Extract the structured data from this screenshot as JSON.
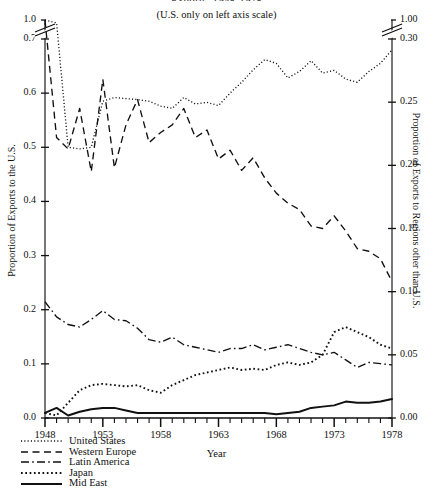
{
  "title": "Exports, 1948-1978",
  "subtitle": "(U.S. only on left axis scale)",
  "axis": {
    "left_label": "Proportion of Exports to the U.S.",
    "right_label": "Proportion of Exports to Regions other than U.S.",
    "x_label": "Year",
    "left_ticks": [
      "0.0",
      "0.1",
      "0.2",
      "0.3",
      "0.4",
      "0.5",
      "0.6",
      "0.7",
      "1.0"
    ],
    "right_ticks": [
      "0.00",
      "0.05",
      "0.10",
      "0.15",
      "0.20",
      "0.25",
      "0.30",
      "1.00"
    ],
    "x_ticks": [
      "1948",
      "1953",
      "1958",
      "1963",
      "1968",
      "1973",
      "1978"
    ]
  },
  "legend": [
    {
      "label": "United States",
      "style": "fine-dotted"
    },
    {
      "label": "Western Europe",
      "style": "dashed"
    },
    {
      "label": "Latin America",
      "style": "dash-dot"
    },
    {
      "label": "Japan",
      "style": "dotted"
    },
    {
      "label": "Mid East",
      "style": "solid"
    }
  ],
  "chart_data": {
    "type": "line",
    "title": "Exports, 1948-1978",
    "subtitle": "(U.S. only on left axis scale)",
    "xlabel": "Year",
    "ylabel": "Proportion of Exports to the U.S.",
    "ylabel_right": "Proportion of Exports to Regions other than U.S.",
    "xlim": [
      1948,
      1978
    ],
    "ylim_left": [
      0.0,
      0.7
    ],
    "ylim_right": [
      0.0,
      0.3
    ],
    "left_axis_break": {
      "below": 0.7,
      "above": 1.0
    },
    "right_axis_break": {
      "below": 0.3,
      "above": 1.0
    },
    "grid": false,
    "legend_position": "below-left",
    "x": [
      1948,
      1949,
      1950,
      1951,
      1952,
      1953,
      1954,
      1955,
      1956,
      1957,
      1958,
      1959,
      1960,
      1961,
      1962,
      1963,
      1964,
      1965,
      1966,
      1967,
      1968,
      1969,
      1970,
      1971,
      1972,
      1973,
      1974,
      1975,
      1976,
      1977,
      1978
    ],
    "series": [
      {
        "name": "United States",
        "axis": "left",
        "style": "fine-dotted",
        "values": [
          0.735,
          0.73,
          0.5,
          0.497,
          0.5,
          0.585,
          0.592,
          0.59,
          0.588,
          0.585,
          0.576,
          0.572,
          0.592,
          0.58,
          0.583,
          0.577,
          0.6,
          0.62,
          0.643,
          0.662,
          0.655,
          0.628,
          0.64,
          0.66,
          0.637,
          0.642,
          0.626,
          0.62,
          0.64,
          0.655,
          0.68
        ]
      },
      {
        "name": "Western Europe",
        "axis": "right",
        "style": "dashed",
        "values": [
          0.315,
          0.222,
          0.213,
          0.245,
          0.195,
          0.268,
          0.198,
          0.232,
          0.252,
          0.218,
          0.226,
          0.232,
          0.245,
          0.222,
          0.228,
          0.205,
          0.212,
          0.196,
          0.206,
          0.19,
          0.178,
          0.17,
          0.165,
          0.152,
          0.15,
          0.16,
          0.148,
          0.134,
          0.132,
          0.126,
          0.108
        ]
      },
      {
        "name": "Latin America",
        "axis": "right",
        "style": "dash-dot",
        "values": [
          0.092,
          0.08,
          0.074,
          0.072,
          0.078,
          0.085,
          0.078,
          0.077,
          0.071,
          0.062,
          0.06,
          0.064,
          0.058,
          0.056,
          0.054,
          0.052,
          0.055,
          0.055,
          0.058,
          0.054,
          0.056,
          0.058,
          0.055,
          0.052,
          0.05,
          0.052,
          0.046,
          0.04,
          0.044,
          0.043,
          0.042
        ]
      },
      {
        "name": "Japan",
        "axis": "right",
        "style": "dotted",
        "values": [
          0.004,
          0.002,
          0.012,
          0.022,
          0.026,
          0.027,
          0.026,
          0.025,
          0.026,
          0.022,
          0.02,
          0.026,
          0.03,
          0.034,
          0.036,
          0.038,
          0.04,
          0.038,
          0.039,
          0.038,
          0.042,
          0.044,
          0.042,
          0.044,
          0.05,
          0.068,
          0.072,
          0.068,
          0.064,
          0.058,
          0.055
        ]
      },
      {
        "name": "Mid East",
        "axis": "right",
        "style": "solid",
        "values": [
          0.004,
          0.008,
          0.002,
          0.005,
          0.007,
          0.008,
          0.008,
          0.006,
          0.004,
          0.004,
          0.004,
          0.004,
          0.004,
          0.004,
          0.004,
          0.004,
          0.004,
          0.004,
          0.004,
          0.004,
          0.003,
          0.004,
          0.005,
          0.008,
          0.009,
          0.01,
          0.013,
          0.012,
          0.012,
          0.013,
          0.015
        ]
      }
    ]
  }
}
